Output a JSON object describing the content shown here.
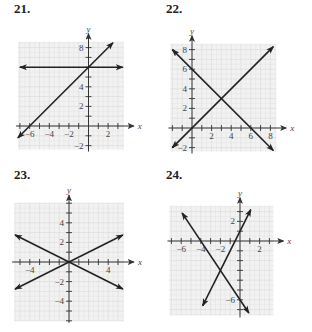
{
  "problems": [
    {
      "number": "21.",
      "x_label": "x",
      "y_label": "y"
    },
    {
      "number": "22.",
      "x_label": "x",
      "y_label": "y"
    },
    {
      "number": "23.",
      "x_label": "x",
      "y_label": "y"
    },
    {
      "number": "24.",
      "x_label": "x",
      "y_label": "y"
    }
  ],
  "chart_data": [
    {
      "type": "line",
      "title": "21.",
      "xlabel": "x",
      "ylabel": "y",
      "xlim": [
        -7.2,
        3.6
      ],
      "ylim": [
        -2.4,
        8.6
      ],
      "grid": true,
      "x_tick_labels": [
        "-6",
        "-4",
        "-2",
        "2"
      ],
      "y_tick_labels": [
        "8",
        "4",
        "2",
        "-2"
      ],
      "series": [
        {
          "name": "horizontal line",
          "equation": "y = 6",
          "points": [
            [
              -7,
              6
            ],
            [
              3.5,
              6
            ]
          ]
        },
        {
          "name": "rising line",
          "equation": "y = x + 6",
          "points": [
            [
              -7.2,
              -1.2
            ],
            [
              2.5,
              8.5
            ]
          ]
        }
      ]
    },
    {
      "type": "line",
      "title": "22.",
      "xlabel": "x",
      "ylabel": "y",
      "xlim": [
        -2.2,
        8.6
      ],
      "ylim": [
        -2.4,
        8.6
      ],
      "grid": true,
      "x_tick_labels": [
        "2",
        "4",
        "6",
        "8"
      ],
      "y_tick_labels": [
        "8",
        "6",
        "4",
        "2",
        "-2"
      ],
      "series": [
        {
          "name": "rising line",
          "equation": "y = x",
          "points": [
            [
              -2,
              -2
            ],
            [
              8.3,
              8.3
            ]
          ]
        },
        {
          "name": "falling line",
          "equation": "y = -x + 6",
          "points": [
            [
              -2,
              8
            ],
            [
              8.3,
              -2.3
            ]
          ]
        }
      ],
      "intersection": [
        3,
        3
      ]
    },
    {
      "type": "line",
      "title": "23.",
      "xlabel": "x",
      "ylabel": "y",
      "xlim": [
        -5.6,
        5.6
      ],
      "ylim": [
        -6,
        6
      ],
      "grid": true,
      "x_tick_labels": [
        "-4",
        "4"
      ],
      "y_tick_labels": [
        "4",
        "2",
        "-2",
        "-4"
      ],
      "series": [
        {
          "name": "rising line",
          "equation": "y = x/2",
          "points": [
            [
              -5.5,
              -2.75
            ],
            [
              5.5,
              2.75
            ]
          ]
        },
        {
          "name": "falling line",
          "equation": "y = -x/2",
          "points": [
            [
              -5.5,
              2.75
            ],
            [
              5.5,
              -2.75
            ]
          ]
        }
      ],
      "intersection": [
        0,
        0
      ]
    },
    {
      "type": "line",
      "title": "24.",
      "xlabel": "x",
      "ylabel": "y",
      "xlim": [
        -7.2,
        3.4
      ],
      "ylim": [
        -7.6,
        3.6
      ],
      "grid": true,
      "x_tick_labels": [
        "-6",
        "-4",
        "-2",
        "2"
      ],
      "y_tick_labels": [
        "2",
        "-6"
      ],
      "series": [
        {
          "name": "steep rising line",
          "equation": "y = 2x + 1",
          "points": [
            [
              -3.8,
              -6.6
            ],
            [
              1.1,
              3.2
            ]
          ]
        },
        {
          "name": "falling line",
          "equation": "y = -1.5x - 6",
          "points": [
            [
              -5.9,
              2.85
            ],
            [
              0.9,
              -7.35
            ]
          ]
        }
      ],
      "intersection": [
        -2,
        -3
      ]
    }
  ]
}
